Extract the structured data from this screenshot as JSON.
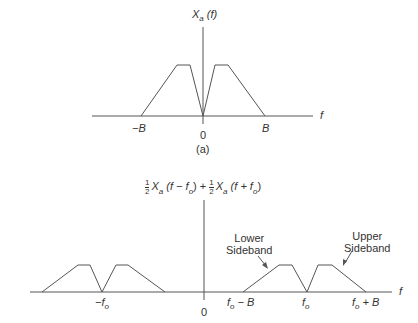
{
  "figure_a": {
    "ylabel_main": "X",
    "ylabel_sub": "a",
    "ylabel_arg": "(f)",
    "xlabel": "f",
    "ticks": {
      "neg_B": "−B",
      "zero": "0",
      "B": "B"
    },
    "caption": "(a)"
  },
  "figure_b": {
    "ylabel": {
      "frac_num": "1",
      "frac_den": "2",
      "term1_main": "X",
      "term1_sub": "a",
      "term1_arg_pre": "(f − f",
      "term1_arg_sub": "o",
      "term1_arg_post": ") +",
      "term2_main": "X",
      "term2_sub": "a",
      "term2_arg_pre": "(f + f",
      "term2_arg_sub": "o",
      "term2_arg_post": ")"
    },
    "xlabel": "f",
    "ticks": {
      "neg_fo_main": "−f",
      "neg_fo_sub": "o",
      "zero": "0",
      "fo_minus_B_main": "f",
      "fo_minus_B_sub": "o",
      "fo_minus_B_rest": " − B",
      "fo_main": "f",
      "fo_sub": "o",
      "fo_plus_B_main": "f",
      "fo_plus_B_sub": "o",
      "fo_plus_B_rest": " + B"
    },
    "annotations": {
      "lower_line1": "Lower",
      "lower_line2": "Sideband",
      "upper_line1": "Upper",
      "upper_line2": "Sideband"
    }
  },
  "colors": {
    "line": "#555555",
    "text": "#333333"
  }
}
